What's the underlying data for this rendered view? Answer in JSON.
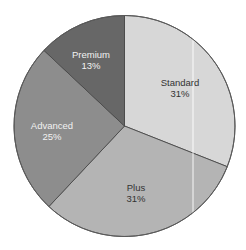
{
  "chart_data": {
    "type": "pie",
    "title": "",
    "start_angle_deg": 0,
    "direction": "clockwise",
    "categories": [
      "Standard",
      "Plus",
      "Advanced",
      "Premium"
    ],
    "values": [
      31,
      31,
      25,
      13
    ],
    "labels": [
      "31%",
      "31%",
      "25%",
      "13%"
    ],
    "colors": [
      "#d7d7d7",
      "#b4b4b4",
      "#8d8d8d",
      "#676767"
    ],
    "label_colors": [
      "#333333",
      "#333333",
      "#f2f2f2",
      "#f2f2f2"
    ],
    "legend": "none",
    "edge_color": "#4a4a4a"
  },
  "slices": [
    {
      "name": "Standard",
      "pct": "31%"
    },
    {
      "name": "Plus",
      "pct": "31%"
    },
    {
      "name": "Advanced",
      "pct": "25%"
    },
    {
      "name": "Premium",
      "pct": "13%"
    }
  ]
}
